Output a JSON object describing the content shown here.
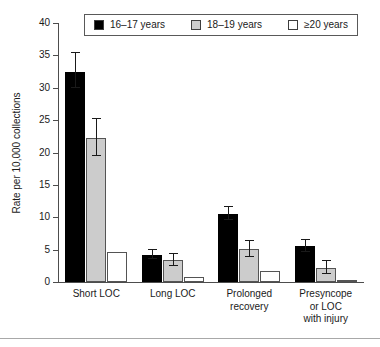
{
  "chart_data": {
    "type": "bar",
    "title": "",
    "subtitle": "",
    "xlabel": "",
    "ylabel": "Rate per 10,000 collections",
    "ylim": [
      0,
      40
    ],
    "yticks": [
      0,
      5,
      10,
      15,
      20,
      25,
      30,
      35,
      40
    ],
    "ytick_labels": [
      "0",
      "5",
      "10",
      "15",
      "20",
      "25",
      "30",
      "35",
      "40"
    ],
    "grid": false,
    "legend_position": "top",
    "categories": [
      "Short LOC",
      "Long LOC",
      "Prolonged recovery",
      "Presyncope or LOC with injury"
    ],
    "category_label_lines": [
      [
        "Short LOC"
      ],
      [
        "Long LOC"
      ],
      [
        "Prolonged",
        "recovery"
      ],
      [
        "Presyncope",
        "or LOC",
        "with injury"
      ]
    ],
    "series": [
      {
        "name": "16–17 years",
        "color": "#000000",
        "values": [
          32.5,
          4.2,
          10.5,
          5.5
        ],
        "err_low": [
          30.0,
          3.6,
          9.6,
          4.6
        ],
        "err_high": [
          35.3,
          4.9,
          11.6,
          6.5
        ]
      },
      {
        "name": "18–19 years",
        "color": "#cccccc",
        "values": [
          22.2,
          3.4,
          5.1,
          2.2
        ],
        "err_low": [
          19.5,
          2.4,
          3.8,
          1.2
        ],
        "err_high": [
          25.2,
          4.3,
          6.4,
          3.2
        ]
      },
      {
        "name": "≥20 years",
        "color": "#ffffff",
        "values": [
          4.7,
          0.8,
          1.7,
          0.2
        ],
        "err_low": [
          null,
          null,
          null,
          null
        ],
        "err_high": [
          null,
          null,
          null,
          null
        ]
      }
    ]
  },
  "legend": {
    "entries": [
      {
        "label": "16–17 years",
        "color": "#000000"
      },
      {
        "label": "18–19 years",
        "color": "#cccccc"
      },
      {
        "label": "≥20 years",
        "color": "#ffffff"
      }
    ]
  },
  "axes": {
    "y_title": "Rate per 10,000 collections"
  }
}
